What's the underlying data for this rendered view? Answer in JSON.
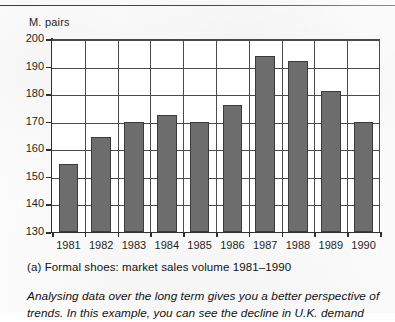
{
  "page": {
    "top_rule": "horizontal-rule"
  },
  "chart_data": {
    "type": "bar",
    "title": "",
    "ylabel": "M. pairs",
    "xlabel": "",
    "ylim": [
      130,
      200
    ],
    "ytick_step": 10,
    "yticks": [
      "200",
      "190",
      "180",
      "170",
      "160",
      "150",
      "140",
      "130"
    ],
    "grid": true,
    "legend": null,
    "categories": [
      "1981",
      "1982",
      "1983",
      "1984",
      "1985",
      "1986",
      "1987",
      "1988",
      "1989",
      "1990"
    ],
    "values": [
      154.5,
      164.5,
      170,
      172.5,
      170,
      176,
      194,
      192,
      181,
      170
    ],
    "series_name": "Formal shoes market sales volume",
    "bar_color": "#6d6d6d",
    "bar_border_color": "#3b3b3b",
    "axis_color": "#2f2f2f",
    "grid_color": "#4a4a4a"
  },
  "caption": {
    "label": "(a) Formal shoes: market sales volume 1981–1990"
  },
  "body": {
    "line1": "Analysing data over the long term gives you a better perspective",
    "line2": "of trends. In this example, you can see the decline in U.K. demand"
  }
}
